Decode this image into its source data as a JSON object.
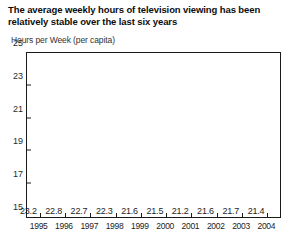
{
  "chart_data": {
    "type": "bar",
    "title": "The average weekly hours of television viewing has been relatively stable over the last six years",
    "subtitle": "Hours per Week (per capita)",
    "xlabel": "",
    "ylabel": "Hours per Week (per capita)",
    "categories": [
      "1995",
      "1996",
      "1997",
      "1998",
      "1999",
      "2000",
      "2001",
      "2002",
      "2003",
      "2004"
    ],
    "values": [
      23.2,
      22.8,
      22.7,
      22.3,
      21.6,
      21.5,
      21.2,
      21.6,
      21.7,
      21.4
    ],
    "value_labels": [
      "23.2",
      "22.8",
      "22.7",
      "22.3",
      "21.6",
      "21.5",
      "21.2",
      "21.6",
      "21.7",
      "21.4"
    ],
    "ylim": [
      15,
      25
    ],
    "yticks": [
      25,
      23,
      21,
      19,
      17,
      15
    ],
    "ytick_labels": [
      "25",
      "23",
      "21",
      "19",
      "17",
      "15"
    ],
    "grid": false,
    "legend": null,
    "bar_color": "#7d7d7d",
    "axis_color": "#1a1a1a",
    "background_color": "#ffffff"
  }
}
